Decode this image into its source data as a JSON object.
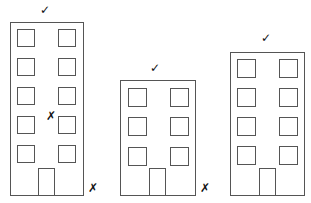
{
  "diagram": {
    "stroke_color": "#555555",
    "buildings": [
      {
        "id": "building-1",
        "rect": [
          10,
          22,
          73,
          173
        ],
        "top_mark": "✓",
        "top_mark_pos": [
          40,
          4
        ],
        "windows": [
          [
            17,
            29
          ],
          [
            58,
            29
          ],
          [
            17,
            58
          ],
          [
            58,
            58
          ],
          [
            17,
            87
          ],
          [
            58,
            87
          ],
          [
            17,
            116
          ],
          [
            58,
            116
          ],
          [
            17,
            145
          ],
          [
            58,
            145
          ]
        ],
        "window_size": 17,
        "door": [
          38,
          168,
          16,
          27
        ],
        "inner_mark": "✗",
        "inner_mark_pos": [
          46,
          110
        ],
        "side_mark": "✗",
        "side_mark_pos": [
          88,
          182
        ]
      },
      {
        "id": "building-2",
        "rect": [
          120,
          80,
          75,
          115
        ],
        "top_mark": "✓",
        "top_mark_pos": [
          150,
          62
        ],
        "windows": [
          [
            128,
            88
          ],
          [
            170,
            88
          ],
          [
            128,
            117
          ],
          [
            170,
            117
          ],
          [
            128,
            147
          ],
          [
            170,
            147
          ]
        ],
        "window_size": 18,
        "door": [
          149,
          168,
          16,
          27
        ],
        "side_mark": "✗",
        "side_mark_pos": [
          200,
          182
        ]
      },
      {
        "id": "building-3",
        "rect": [
          230,
          52,
          74,
          143
        ],
        "top_mark": "✓",
        "top_mark_pos": [
          261,
          32
        ],
        "windows": [
          [
            237,
            59
          ],
          [
            279,
            59
          ],
          [
            237,
            88
          ],
          [
            279,
            88
          ],
          [
            237,
            117
          ],
          [
            279,
            117
          ],
          [
            237,
            146
          ],
          [
            279,
            146
          ]
        ],
        "window_size": 18,
        "door": [
          259,
          168,
          16,
          27
        ]
      }
    ]
  }
}
